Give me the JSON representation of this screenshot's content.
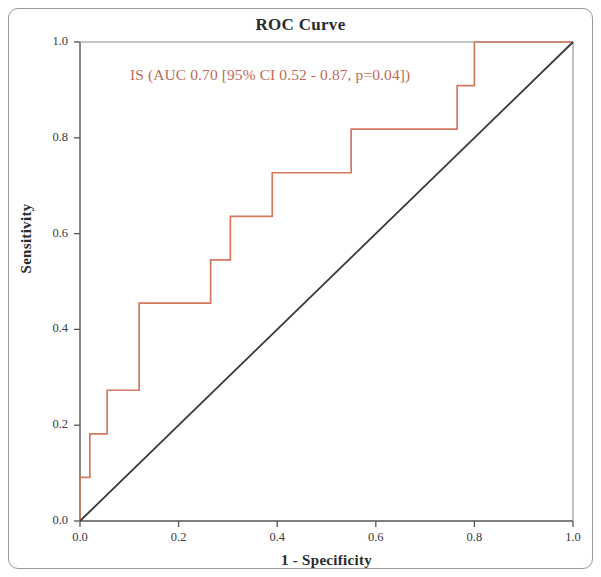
{
  "chart_data": {
    "type": "line",
    "title": "ROC Curve",
    "xlabel": "1 - Specificity",
    "ylabel": "Sensitivity",
    "xlim": [
      0.0,
      1.0
    ],
    "ylim": [
      0.0,
      1.0
    ],
    "grid": false,
    "legend_position": "inside-top-left",
    "annotations": [
      {
        "name": "auc-annotation",
        "text": "IS (AUC 0.70 [95% CI 0.52 - 0.87, p=0.04])",
        "color": "#c06a55"
      }
    ],
    "x_ticks": [
      "0.0",
      "0.2",
      "0.4",
      "0.6",
      "0.8",
      "1.0"
    ],
    "x_tick_values": [
      0.0,
      0.2,
      0.4,
      0.6,
      0.8,
      1.0
    ],
    "y_ticks": [
      "0.0",
      "0.2",
      "0.4",
      "0.6",
      "0.8",
      "1.0"
    ],
    "y_tick_values": [
      0.0,
      0.2,
      0.4,
      0.6,
      0.8,
      1.0
    ],
    "series": [
      {
        "name": "IS",
        "label": "IS (AUC 0.70 [95% CI 0.52 - 0.87, p=0.04])",
        "color": "#d4785f",
        "style": "step",
        "auc": 0.7,
        "ci_low": 0.52,
        "ci_high": 0.87,
        "p_value": 0.04,
        "points": [
          [
            0.0,
            0.0
          ],
          [
            0.0,
            0.091
          ],
          [
            0.02,
            0.091
          ],
          [
            0.02,
            0.182
          ],
          [
            0.055,
            0.182
          ],
          [
            0.055,
            0.273
          ],
          [
            0.12,
            0.273
          ],
          [
            0.12,
            0.455
          ],
          [
            0.265,
            0.455
          ],
          [
            0.265,
            0.545
          ],
          [
            0.305,
            0.545
          ],
          [
            0.305,
            0.636
          ],
          [
            0.39,
            0.636
          ],
          [
            0.39,
            0.727
          ],
          [
            0.55,
            0.727
          ],
          [
            0.55,
            0.818
          ],
          [
            0.765,
            0.818
          ],
          [
            0.765,
            0.909
          ],
          [
            0.8,
            0.909
          ],
          [
            0.8,
            1.0
          ],
          [
            1.0,
            1.0
          ]
        ]
      },
      {
        "name": "Reference",
        "label": "Reference line",
        "color": "#3a3a3a",
        "style": "diagonal",
        "points": [
          [
            0.0,
            0.0
          ],
          [
            1.0,
            1.0
          ]
        ]
      }
    ]
  },
  "figure": {
    "title": "ROC Curve",
    "x_axis_title": "1 - Specificity",
    "y_axis_title": "Sensitivity",
    "legend_text": "IS (AUC 0.70 [95% CI 0.52 - 0.87, p=0.04])",
    "curve_color": "#d4785f",
    "reference_color": "#3a3a3a",
    "frame_color": "#9a9a9a"
  }
}
